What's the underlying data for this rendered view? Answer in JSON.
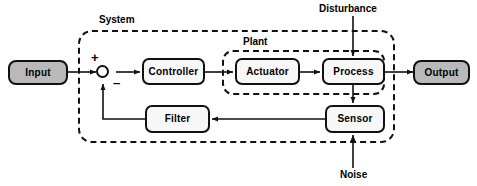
{
  "diagram": {
    "groups": [
      {
        "key": "system",
        "label": "System"
      },
      {
        "key": "plant",
        "label": "Plant"
      }
    ],
    "blocks": [
      {
        "key": "input",
        "label": "Input",
        "style": "gray"
      },
      {
        "key": "controller",
        "label": "Controller",
        "style": "white"
      },
      {
        "key": "actuator",
        "label": "Actuator",
        "style": "white"
      },
      {
        "key": "process",
        "label": "Process",
        "style": "white"
      },
      {
        "key": "output",
        "label": "Output",
        "style": "gray"
      },
      {
        "key": "sensor",
        "label": "Sensor",
        "style": "white"
      },
      {
        "key": "filter",
        "label": "Filter",
        "style": "white"
      }
    ],
    "external_signals": [
      {
        "key": "disturbance",
        "label": "Disturbance",
        "enters": "process"
      },
      {
        "key": "noise",
        "label": "Noise",
        "enters": "sensor"
      }
    ],
    "summing_junction": {
      "name": "summing-junction",
      "positive_sign": "+",
      "negative_sign": "–"
    },
    "colors": {
      "line": "#111111",
      "block_fill": "#f7f7f7",
      "terminal_fill": "#b9b9b9",
      "border": "#111111",
      "background": "#ffffff"
    }
  }
}
